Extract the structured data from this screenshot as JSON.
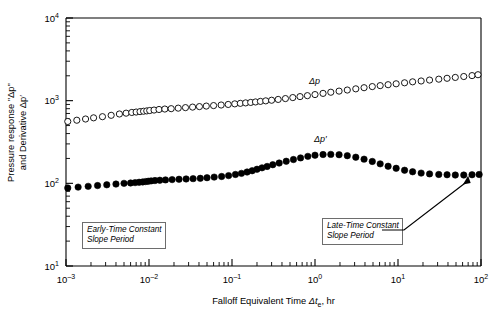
{
  "chart_data": {
    "type": "scatter",
    "title": "",
    "xlabel": "Falloff Equivalent Time Δtₑ, hr",
    "ylabel": "Pressure response \"Δp\" and Derivative Δp′",
    "xscale": "log",
    "yscale": "log",
    "xlim": [
      0.001,
      100
    ],
    "ylim": [
      10,
      10000
    ],
    "grid": false,
    "legend_position": "inline-annotation",
    "xticks": [
      0.001,
      0.01,
      0.1,
      1,
      10,
      100
    ],
    "xticklabels": [
      "10⁻³",
      "10⁻²",
      "10⁻¹",
      "10⁰",
      "10¹",
      "10²"
    ],
    "yticks": [
      10,
      100,
      1000,
      10000
    ],
    "yticklabels": [
      "10¹",
      "10²",
      "10³",
      "10⁴"
    ],
    "series": [
      {
        "name": "Δp",
        "marker": "open-circle",
        "color": "#000000",
        "fill": "#ffffff",
        "x": [
          0.00105,
          0.00135,
          0.00172,
          0.00215,
          0.00275,
          0.0035,
          0.0044,
          0.0053,
          0.0062,
          0.007,
          0.0078,
          0.0086,
          0.0094,
          0.0102,
          0.0115,
          0.0132,
          0.0155,
          0.0185,
          0.0225,
          0.0275,
          0.0335,
          0.0405,
          0.049,
          0.06,
          0.074,
          0.09,
          0.108,
          0.126,
          0.146,
          0.168,
          0.192,
          0.22,
          0.255,
          0.3,
          0.36,
          0.44,
          0.54,
          0.66,
          0.81,
          1.0,
          1.25,
          1.55,
          1.95,
          2.45,
          3.1,
          3.9,
          4.9,
          6.1,
          7.6,
          9.5,
          12.0,
          15.0,
          19.0,
          24.0,
          31.0,
          39.0,
          49.0,
          62.0,
          78.0,
          92.0
        ],
        "y": [
          560,
          580,
          600,
          620,
          640,
          665,
          690,
          706,
          720,
          728,
          737,
          745,
          752,
          760,
          770,
          782,
          792,
          800,
          812,
          824,
          836,
          848,
          860,
          872,
          886,
          900,
          915,
          928,
          940,
          952,
          965,
          980,
          995,
          1012,
          1035,
          1060,
          1090,
          1120,
          1150,
          1185,
          1225,
          1265,
          1305,
          1345,
          1390,
          1435,
          1480,
          1520,
          1560,
          1600,
          1645,
          1690,
          1730,
          1775,
          1820,
          1865,
          1910,
          1960,
          2010,
          2060
        ]
      },
      {
        "name": "Δp′",
        "marker": "filled-circle",
        "color": "#000000",
        "fill": "#000000",
        "x": [
          0.00105,
          0.0014,
          0.00185,
          0.0024,
          0.0031,
          0.004,
          0.005,
          0.006,
          0.0068,
          0.0076,
          0.0084,
          0.0091,
          0.0098,
          0.0106,
          0.0118,
          0.0135,
          0.0158,
          0.019,
          0.023,
          0.028,
          0.034,
          0.0415,
          0.05,
          0.061,
          0.075,
          0.091,
          0.11,
          0.13,
          0.152,
          0.175,
          0.2,
          0.23,
          0.265,
          0.31,
          0.37,
          0.45,
          0.55,
          0.67,
          0.82,
          1.0,
          1.25,
          1.55,
          1.95,
          2.45,
          3.1,
          3.9,
          4.9,
          6.1,
          7.6,
          9.5,
          12.0,
          15.0,
          19.0,
          24.0,
          31.0,
          39.0,
          49.0,
          62.0,
          78.0,
          95.0
        ],
        "y": [
          88,
          90,
          92,
          94,
          96,
          98,
          100,
          101,
          102,
          103,
          104,
          105,
          106,
          107,
          108,
          109,
          110,
          111,
          112,
          113,
          114,
          115,
          117,
          119,
          121,
          124,
          128,
          132,
          137,
          142,
          148,
          154,
          160,
          168,
          176,
          185,
          194,
          203,
          212,
          219,
          223,
          224,
          222,
          216,
          207,
          196,
          184,
          172,
          161,
          152,
          144,
          138,
          133,
          130,
          128,
          127,
          126,
          126,
          127,
          128
        ]
      }
    ],
    "annotations": [
      {
        "id": "early-time-box",
        "text_lines": [
          "Early-Time Constant",
          "Slope Period"
        ],
        "style": "italic-boxed"
      },
      {
        "id": "late-time-box",
        "text_lines": [
          "Late-Time Constant",
          "Slope Period"
        ],
        "style": "italic-boxed",
        "arrow": true,
        "arrow_target_x": 70,
        "arrow_target_y": 127
      },
      {
        "id": "delta-p-label",
        "text": "Δp",
        "style": "italic"
      },
      {
        "id": "delta-p-prime-label",
        "text": "Δp′",
        "style": "italic"
      }
    ]
  },
  "axes": {
    "x_label_prefix": "Falloff Equivalent Time ",
    "x_label_symbol": "Δt",
    "x_label_subscript": "e",
    "x_label_suffix": ", hr",
    "y_label_line1": "Pressure response \"Δp\"",
    "y_label_line2": "and Derivative Δp′"
  },
  "colors": {
    "axis": "#000000",
    "marker_open_stroke": "#000000",
    "marker_filled": "#000000",
    "box_border": "#6d6d6d",
    "background": "#ffffff"
  }
}
